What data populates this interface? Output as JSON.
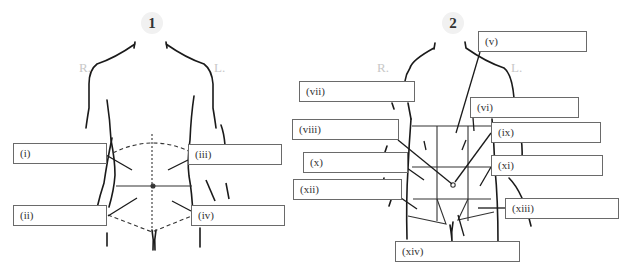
{
  "figures": [
    {
      "number": "1",
      "side_right": "R.",
      "side_left": "L.",
      "labels": [
        "(i)",
        "(ii)",
        "(iii)",
        "(iv)"
      ]
    },
    {
      "number": "2",
      "side_right": "R.",
      "side_left": "L.",
      "labels": [
        "(v)",
        "(vi)",
        "(vii)",
        "(viii)",
        "(ix)",
        "(x)",
        "(xi)",
        "(xii)",
        "(xiii)",
        "(xiv)"
      ]
    }
  ],
  "colors": {
    "line": "#1a1a1a",
    "box_border": "#6a6a6a",
    "side_text": "#c8c8c8",
    "badge_bg": "#f1f1f1"
  }
}
